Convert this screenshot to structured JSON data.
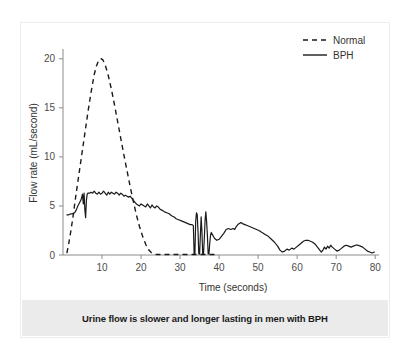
{
  "figure": {
    "caption": "Urine flow is slower and longer lasting in men with BPH"
  },
  "chart_data": {
    "type": "line",
    "title": "",
    "xlabel": "Time (seconds)",
    "ylabel": "Flow rate (mL/second)",
    "xlim": [
      0,
      82
    ],
    "ylim": [
      0,
      21
    ],
    "xticks": [
      10,
      20,
      30,
      40,
      50,
      60,
      70,
      80
    ],
    "xtick_labels": [
      "10",
      "20",
      "30",
      "40",
      "50",
      "60",
      "70",
      "80"
    ],
    "yticks": [
      0,
      5,
      10,
      15,
      20
    ],
    "ytick_labels": [
      "0",
      "5",
      "10",
      "15",
      "20"
    ],
    "grid": false,
    "legend_position": "top-right",
    "legend": [
      "Normal",
      "BPH"
    ],
    "line_color": "#1a1a1a",
    "axis_color": "#8c8c8c",
    "series": [
      {
        "name": "Normal",
        "style": "dashed",
        "x": [
          1.0,
          1.4,
          2.0,
          2.6,
          3.2,
          4.0,
          4.8,
          5.6,
          6.4,
          7.2,
          8.0,
          8.6,
          9.2,
          9.8,
          10.2,
          10.8,
          11.6,
          12.4,
          13.2,
          14.0,
          14.8,
          15.6,
          16.4,
          17.2,
          18.0,
          18.8,
          19.6,
          20.4,
          21.2,
          22.0,
          22.6,
          23.2,
          24.0,
          26.0,
          28.0,
          30.0,
          32.0,
          34.0,
          36.0,
          38.0,
          39.5
        ],
        "y": [
          0.2,
          1.0,
          2.4,
          4.0,
          5.8,
          8.0,
          10.2,
          12.4,
          14.6,
          16.6,
          18.4,
          19.3,
          19.9,
          20.0,
          19.9,
          19.4,
          18.3,
          16.9,
          15.3,
          13.6,
          11.9,
          10.2,
          8.6,
          7.0,
          5.5,
          4.1,
          2.9,
          1.9,
          1.1,
          0.5,
          0.25,
          0.1,
          0.05,
          0.05,
          0.05,
          0.05,
          0.05,
          0.05,
          0.05,
          0.05,
          0.05
        ]
      },
      {
        "name": "BPH",
        "style": "solid",
        "x": [
          1.0,
          1.5,
          2.0,
          2.5,
          3.0,
          3.4,
          3.8,
          4.2,
          4.6,
          5.0,
          5.2,
          5.4,
          5.6,
          5.8,
          6.0,
          6.2,
          6.4,
          6.8,
          7.2,
          7.6,
          8.0,
          8.4,
          8.8,
          9.2,
          9.6,
          10.0,
          10.4,
          10.8,
          11.2,
          11.6,
          12.0,
          12.4,
          12.8,
          13.2,
          13.6,
          14.0,
          14.4,
          14.8,
          15.2,
          15.6,
          16.0,
          16.4,
          16.8,
          17.2,
          17.6,
          18.0,
          18.4,
          18.8,
          19.2,
          19.6,
          20.0,
          20.4,
          20.8,
          21.2,
          21.6,
          22.0,
          22.4,
          22.8,
          23.2,
          23.6,
          24.0,
          24.4,
          24.8,
          25.2,
          25.6,
          26.0,
          26.6,
          27.2,
          27.8,
          28.4,
          29.0,
          29.6,
          30.2,
          30.8,
          31.4,
          32.0,
          32.6,
          33.0,
          33.4,
          33.6,
          33.8,
          34.0,
          34.2,
          34.4,
          34.6,
          34.8,
          35.0,
          35.2,
          35.4,
          35.6,
          35.8,
          36.0,
          36.2,
          36.4,
          36.6,
          36.8,
          37.0,
          37.2,
          37.4,
          37.6,
          37.8,
          38.0,
          38.4,
          38.8,
          39.4,
          40.0,
          40.6,
          41.2,
          41.8,
          42.4,
          43.0,
          43.6,
          44.0,
          44.4,
          44.8,
          45.2,
          45.6,
          46.0,
          46.6,
          47.2,
          47.8,
          48.4,
          49.0,
          49.6,
          50.2,
          51.0,
          51.8,
          52.6,
          53.4,
          54.2,
          55.0,
          55.6,
          56.2,
          56.8,
          57.4,
          58.0,
          58.6,
          59.2,
          59.8,
          60.4,
          61.0,
          61.6,
          62.2,
          62.8,
          63.4,
          64.0,
          64.6,
          65.0,
          65.4,
          65.8,
          66.2,
          66.6,
          67.0,
          67.4,
          67.8,
          68.2,
          68.6,
          69.0,
          69.6,
          70.2,
          70.8,
          71.4,
          72.0,
          72.6,
          73.2,
          73.8,
          74.4,
          75.0,
          75.6,
          76.2,
          76.8,
          77.4,
          78.0,
          78.6,
          79.2,
          79.8
        ],
        "y": [
          4.1,
          4.1,
          4.2,
          4.2,
          4.3,
          4.6,
          5.0,
          5.3,
          5.6,
          6.2,
          5.2,
          6.3,
          4.6,
          3.8,
          5.6,
          6.2,
          6.3,
          6.3,
          6.4,
          6.3,
          6.5,
          6.3,
          6.2,
          6.4,
          6.2,
          6.3,
          6.5,
          6.3,
          6.1,
          6.4,
          6.2,
          6.4,
          6.3,
          6.2,
          6.4,
          6.3,
          6.1,
          6.3,
          6.2,
          6.0,
          6.1,
          6.0,
          5.9,
          6.0,
          5.8,
          5.6,
          5.4,
          5.2,
          5.1,
          5.0,
          5.2,
          5.1,
          5.0,
          4.9,
          5.2,
          5.0,
          4.8,
          5.1,
          4.9,
          4.8,
          5.0,
          4.9,
          4.7,
          4.6,
          4.5,
          4.4,
          4.3,
          4.2,
          4.0,
          3.9,
          3.7,
          3.6,
          3.5,
          3.4,
          3.3,
          3.2,
          3.1,
          3.1,
          3.0,
          0.1,
          0.1,
          3.4,
          4.3,
          4.1,
          2.4,
          0.1,
          0.1,
          2.0,
          3.9,
          2.4,
          0.1,
          0.1,
          1.6,
          3.5,
          4.4,
          3.4,
          2.0,
          0.1,
          0.1,
          1.2,
          2.0,
          2.3,
          2.0,
          1.7,
          1.5,
          1.6,
          1.9,
          2.2,
          2.6,
          2.7,
          2.6,
          2.7,
          2.6,
          2.9,
          3.1,
          3.2,
          3.3,
          3.2,
          3.1,
          3.0,
          2.9,
          2.8,
          2.7,
          2.6,
          2.5,
          2.3,
          2.1,
          1.9,
          1.6,
          1.3,
          0.9,
          0.5,
          0.3,
          0.4,
          0.6,
          0.5,
          0.7,
          0.6,
          0.8,
          1.0,
          1.2,
          1.4,
          1.5,
          1.5,
          1.4,
          1.3,
          1.1,
          0.9,
          0.7,
          0.5,
          0.3,
          0.5,
          0.8,
          0.6,
          0.9,
          0.7,
          1.0,
          0.8,
          0.6,
          0.4,
          0.5,
          0.7,
          0.9,
          1.0,
          0.9,
          0.8,
          0.9,
          1.0,
          1.0,
          0.9,
          0.8,
          0.6,
          0.4,
          0.3,
          0.2,
          0.3
        ]
      }
    ]
  }
}
